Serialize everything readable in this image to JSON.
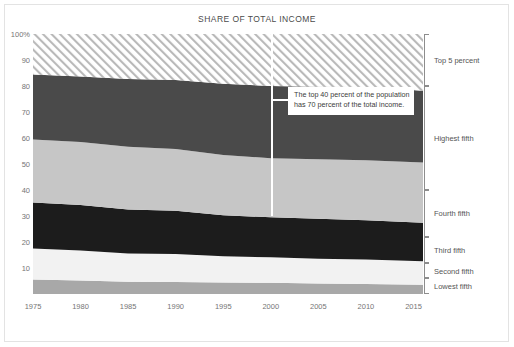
{
  "chart_data": {
    "type": "area",
    "title": "SHARE OF TOTAL INCOME",
    "xlabel": "",
    "ylabel": "",
    "xlim": [
      1975,
      2016
    ],
    "ylim": [
      0,
      100
    ],
    "grid": false,
    "legend_position": "right",
    "x_ticks": [
      "1975",
      "1980",
      "1985",
      "1990",
      "1995",
      "2000",
      "2005",
      "2010",
      "2015"
    ],
    "x_tick_values": [
      1975,
      1980,
      1985,
      1990,
      1995,
      2000,
      2005,
      2010,
      2015
    ],
    "y_ticks": [
      "100%",
      "90",
      "80",
      "70",
      "60",
      "50",
      "40",
      "30",
      "20",
      "10"
    ],
    "y_tick_values": [
      100,
      90,
      80,
      70,
      60,
      50,
      40,
      30,
      20,
      10
    ],
    "stacked": true,
    "stack_order_bottom_to_top": [
      "Lowest fifth",
      "Second fifth",
      "Third fifth",
      "Fourth fifth",
      "Highest fifth",
      "Top 5 percent"
    ],
    "x": [
      1975,
      1980,
      1985,
      1990,
      1995,
      2000,
      2005,
      2010,
      2016
    ],
    "series": [
      {
        "name": "Lowest fifth",
        "color": "#a8a8a8",
        "values": [
          5.6,
          5.2,
          4.7,
          4.6,
          4.4,
          4.3,
          4.0,
          3.8,
          3.6
        ]
      },
      {
        "name": "Second fifth",
        "color": "#f2f2f2",
        "values": [
          11.9,
          11.5,
          10.9,
          10.8,
          10.1,
          9.8,
          9.6,
          9.5,
          9.0
        ]
      },
      {
        "name": "Third fifth",
        "color": "#1c1c1c",
        "values": [
          17.7,
          17.5,
          16.9,
          16.6,
          15.8,
          15.4,
          15.3,
          15.1,
          14.8
        ]
      },
      {
        "name": "Fourth fifth",
        "color": "#c6c6c6",
        "values": [
          24.2,
          24.3,
          24.1,
          23.8,
          23.2,
          22.7,
          22.9,
          23.0,
          23.2
        ]
      },
      {
        "name": "Highest fifth",
        "color": "#4a4a4a",
        "values": [
          25.0,
          25.2,
          26.1,
          26.5,
          27.4,
          27.8,
          27.9,
          28.2,
          27.6
        ]
      },
      {
        "name": "Top 5 percent",
        "color": "#ffffff",
        "pattern": "diagonal-hatch",
        "values": [
          15.6,
          16.3,
          17.3,
          17.7,
          19.1,
          20.0,
          20.3,
          20.4,
          21.8
        ]
      }
    ],
    "boundaries_cumulative_bottom_to_top": {
      "1975": [
        5.6,
        17.5,
        35.2,
        59.4,
        84.4,
        100
      ],
      "2016": [
        3.6,
        12.6,
        27.4,
        50.6,
        78.2,
        100
      ]
    },
    "annotations": [
      {
        "name": "top-40-callout",
        "text_line_1": "The top 40 percent of the population",
        "text_line_2": "has 70 percent of the total income.",
        "marker_year": 2000,
        "marker_value": 30,
        "marker_color": "#ffffff"
      }
    ]
  },
  "legend": {
    "entries": [
      {
        "label": "Top 5 percent",
        "top_percent": 100,
        "bottom_percent": 80
      },
      {
        "label": "Highest fifth",
        "top_percent": 80,
        "bottom_percent": 40
      },
      {
        "label": "Fourth fifth",
        "top_percent": 40,
        "bottom_percent": 22
      },
      {
        "label": "Third fifth",
        "top_percent": 22,
        "bottom_percent": 12
      },
      {
        "label": "Second fifth",
        "top_percent": 12,
        "bottom_percent": 6
      },
      {
        "label": "Lowest fifth",
        "top_percent": 6,
        "bottom_percent": 0
      }
    ]
  },
  "colors": {
    "top5": "#ffffff",
    "hatch": "#b9b9b9",
    "highest": "#4a4a4a",
    "fourth": "#c6c6c6",
    "third": "#1c1c1c",
    "second": "#f2f2f2",
    "lowest": "#a8a8a8",
    "marker": "#ffffff",
    "text": "#555555"
  }
}
